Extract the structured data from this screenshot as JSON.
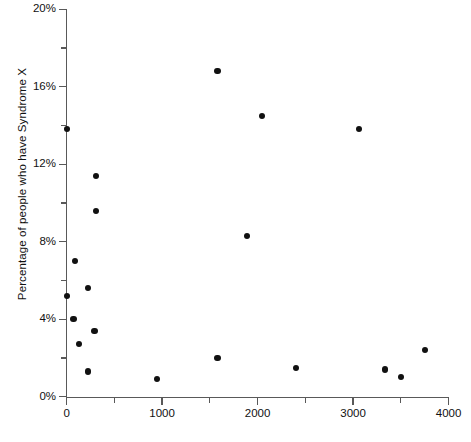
{
  "chart_data": {
    "type": "scatter",
    "title": "",
    "xlabel": "",
    "ylabel": "Percentage of people who have Syndrome X",
    "xlim": [
      0,
      4000
    ],
    "ylim": [
      0,
      20
    ],
    "grid": false,
    "legend": null,
    "x_ticks": [
      0,
      1000,
      2000,
      3000,
      4000
    ],
    "x_tick_labels": [
      "0",
      "1000",
      "2000",
      "3000",
      "4000"
    ],
    "x_minor_ticks": [
      500,
      1500,
      2500,
      3500
    ],
    "y_ticks": [
      0,
      4,
      8,
      12,
      16,
      20
    ],
    "y_tick_labels": [
      "0%",
      "4%",
      "8%",
      "12%",
      "16%",
      "20%"
    ],
    "y_minor_ticks": [
      2,
      6,
      10,
      14,
      18
    ],
    "marker_color": "#111111",
    "axis_color": "#595959",
    "points": [
      {
        "x": 0,
        "y": 13.8
      },
      {
        "x": 0,
        "y": 5.2
      },
      {
        "x": 73,
        "y": 4.0
      },
      {
        "x": 84,
        "y": 7.0
      },
      {
        "x": 126,
        "y": 2.7
      },
      {
        "x": 220,
        "y": 5.6
      },
      {
        "x": 220,
        "y": 1.3
      },
      {
        "x": 293,
        "y": 3.4
      },
      {
        "x": 304,
        "y": 11.4
      },
      {
        "x": 304,
        "y": 9.6
      },
      {
        "x": 950,
        "y": 0.9
      },
      {
        "x": 1581,
        "y": 16.8
      },
      {
        "x": 1581,
        "y": 2.0
      },
      {
        "x": 1885,
        "y": 8.3
      },
      {
        "x": 2042,
        "y": 14.5
      },
      {
        "x": 2400,
        "y": 1.5
      },
      {
        "x": 3058,
        "y": 13.8
      },
      {
        "x": 3330,
        "y": 1.4
      },
      {
        "x": 3500,
        "y": 1.0
      },
      {
        "x": 3750,
        "y": 2.4
      }
    ]
  }
}
